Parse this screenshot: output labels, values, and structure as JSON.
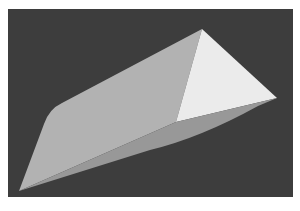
{
  "image": {
    "description": "Rendered 3D wedge / triangular prism on a dark gray background",
    "background_color": "#ffffff",
    "panel": {
      "x": 8,
      "y": 9,
      "width": 285,
      "height": 188,
      "color": "#3d3d3d"
    }
  },
  "shape": {
    "type": "wedge",
    "faces": [
      {
        "name": "top-face",
        "color": "#b2b2b2",
        "path": "M19,191 L44,124 Q49,109 62,103 L202,29 L176,122 Z"
      },
      {
        "name": "lit-face",
        "color": "#ebebeb",
        "path": "M202,29 L277,98 L176,122 Z"
      },
      {
        "name": "bottom-face",
        "color": "#989898",
        "path": "M19,191 L176,122 L277,98 L258,106 Q200,138 150,150 Z"
      }
    ],
    "vertices": {
      "apex": [
        202,
        29
      ],
      "right": [
        277,
        98
      ],
      "inner": [
        176,
        122
      ],
      "bottom_left": [
        19,
        191
      ],
      "left_shoulder": [
        51,
        107
      ]
    }
  }
}
